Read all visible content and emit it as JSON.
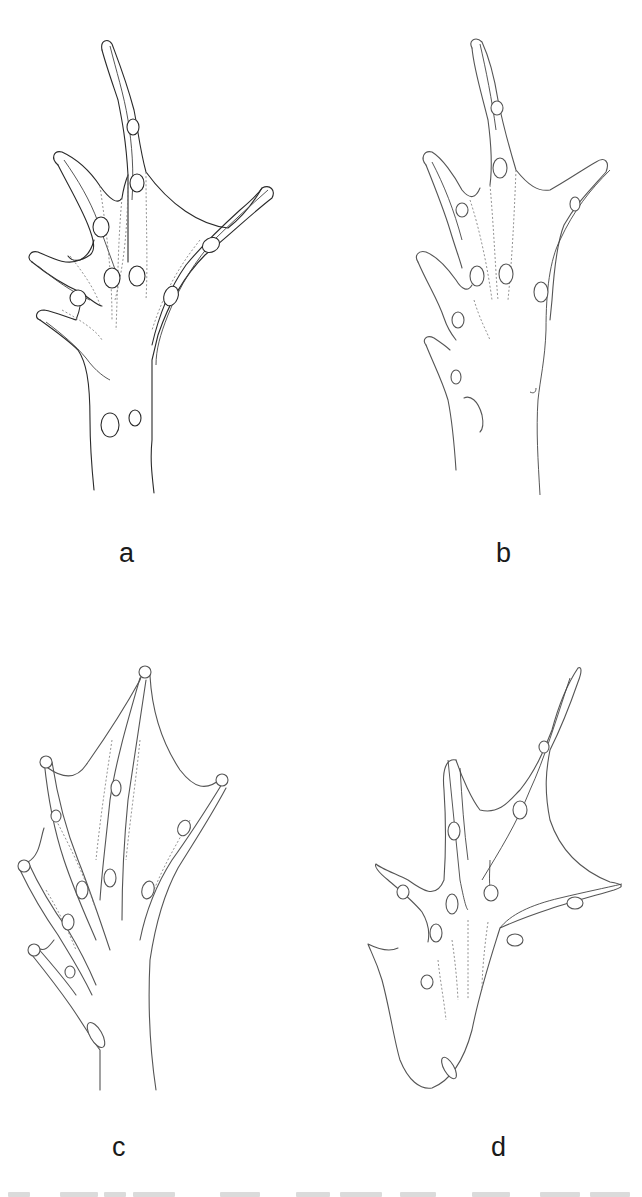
{
  "figure": {
    "panels": [
      {
        "id": "a",
        "label": "a",
        "subject": "webbed foot, dorsal outline, ventral tubercles",
        "tone": "dark"
      },
      {
        "id": "b",
        "label": "b",
        "subject": "webbed foot, reduced webbing",
        "tone": "light"
      },
      {
        "id": "c",
        "label": "c",
        "subject": "webbed foot, extensive webbing to toe tips",
        "tone": "light"
      },
      {
        "id": "d",
        "label": "d",
        "subject": "webbed foot, asymmetric spread toes",
        "tone": "light"
      }
    ],
    "caption": {
      "visible": "truncated",
      "text": ""
    }
  },
  "colors": {
    "background": "#ffffff",
    "line": "#2a2a2a",
    "label": "#1a1a1a"
  }
}
